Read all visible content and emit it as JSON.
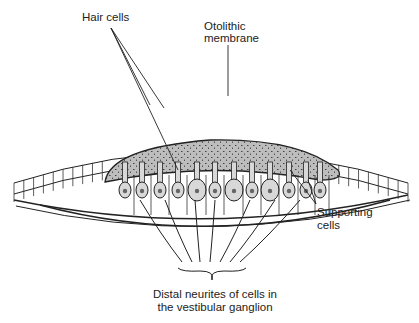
{
  "diagram": {
    "labels": {
      "hair_cells": "Hair cells",
      "otolithic_membrane_line1": "Otolithic",
      "otolithic_membrane_line2": "membrane",
      "supporting_cells_line1": "Supporting",
      "supporting_cells_line2": "cells",
      "neurites_line1": "Distal neurites of cells in",
      "neurites_line2": "the vestibular ganglion"
    },
    "colors": {
      "ink": "#222222",
      "membrane_fill": "#b8b8b8",
      "cell_fill": "#d8d8d8"
    }
  }
}
